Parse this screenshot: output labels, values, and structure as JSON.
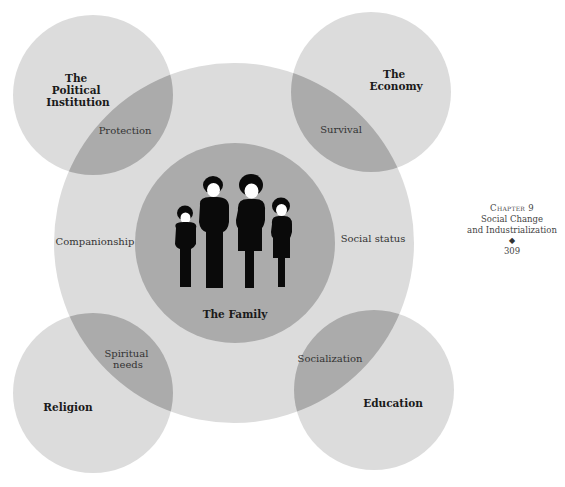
{
  "figure": {
    "central_label": "The Family",
    "institutions": [
      {
        "id": "political",
        "label_lines": [
          "The",
          "Political",
          "Institution"
        ],
        "overlap_label_lines": [
          "Protection"
        ]
      },
      {
        "id": "economy",
        "label_lines": [
          "The",
          "Economy"
        ],
        "overlap_label_lines": [
          "Survival"
        ]
      },
      {
        "id": "religion",
        "label_lines": [
          "Religion"
        ],
        "overlap_label_lines": [
          "Spiritual",
          "needs"
        ]
      },
      {
        "id": "education",
        "label_lines": [
          "Education"
        ],
        "overlap_label_lines": [
          "Socialization"
        ]
      }
    ],
    "ring_labels": {
      "left": "Companionship",
      "right": "Social status"
    },
    "family_icon": "family-silhouettes-icon",
    "colors": {
      "outer_circle": "#dcdcdc",
      "overlap": "#ababab",
      "family_circle": "#ababab",
      "silhouette": "#0a0a0a"
    }
  },
  "page_margin": {
    "chapter": "Chapter 9",
    "title_lines": [
      "Social Change",
      "and Industrialization"
    ],
    "separator": "◆",
    "page_number": "309"
  }
}
